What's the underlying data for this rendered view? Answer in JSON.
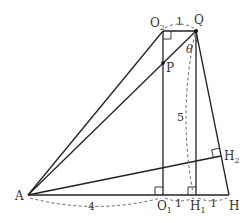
{
  "diagram": {
    "type": "geometry-figure",
    "points": {
      "A": {
        "label": "A",
        "x": 28,
        "y": 195
      },
      "O1": {
        "label": "O",
        "sub": "1",
        "x": 163,
        "y": 195
      },
      "H1": {
        "label": "H",
        "sub": "1",
        "x": 196,
        "y": 195
      },
      "H": {
        "label": "H",
        "x": 229,
        "y": 195
      },
      "O2": {
        "label": "O",
        "sub": "2",
        "x": 163,
        "y": 31
      },
      "Q": {
        "label": "Q",
        "x": 196,
        "y": 31
      },
      "P": {
        "label": "P",
        "x": 163,
        "y": 63
      },
      "H2": {
        "label": "H",
        "sub": "2",
        "x": 221,
        "y": 156
      }
    },
    "measurements": {
      "O2_Q": "1",
      "A_O1": "4",
      "O1_H1": "1",
      "H1_H": "1",
      "Q_H1": "5"
    },
    "angle_label": "θ",
    "segments": [
      {
        "from": "A",
        "to": "H"
      },
      {
        "from": "A",
        "to": "O2"
      },
      {
        "from": "A",
        "to": "Q"
      },
      {
        "from": "A",
        "to": "H2"
      },
      {
        "from": "O2",
        "to": "Q"
      },
      {
        "from": "O2",
        "to": "O1"
      },
      {
        "from": "Q",
        "to": "H1"
      },
      {
        "from": "Q",
        "to": "H"
      }
    ],
    "right_angles": [
      "O2",
      "O1",
      "H1",
      "H2"
    ]
  }
}
